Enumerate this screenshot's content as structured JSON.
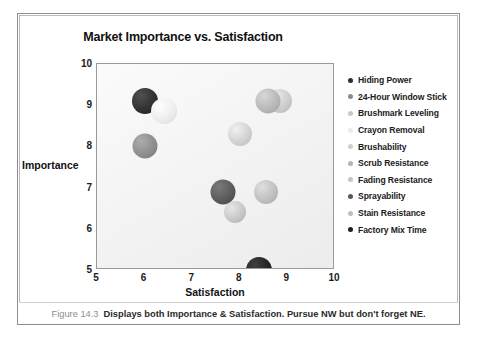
{
  "figure": {
    "caption_number": "Figure 14.3",
    "caption_text": "Displays both Importance & Satisfaction. Pursue NW but don't forget NE."
  },
  "chart_data": {
    "type": "scatter",
    "title": "Market Importance vs. Satisfaction",
    "xlabel": "Satisfaction",
    "ylabel": "Importance",
    "xlim": [
      5,
      10
    ],
    "ylim": [
      5,
      10
    ],
    "xticks": [
      "5",
      "6",
      "7",
      "8",
      "9",
      "10"
    ],
    "yticks": [
      "5",
      "6",
      "7",
      "8",
      "9",
      "10"
    ],
    "grid": false,
    "legend_position": "right",
    "series": [
      {
        "name": "Hiding Power",
        "x": 6.0,
        "y": 9.1,
        "color": "#2e2e2e",
        "size": 26
      },
      {
        "name": "24-Hour Window Stick",
        "x": 6.0,
        "y": 8.0,
        "color": "#8b8b8b",
        "size": 25
      },
      {
        "name": "Brushmark Leveling",
        "x": 8.85,
        "y": 9.1,
        "color": "#c9c9c9",
        "size": 24
      },
      {
        "name": "Crayon Removal",
        "x": 6.4,
        "y": 8.85,
        "color": "#ebebeb",
        "size": 26
      },
      {
        "name": "Brushability",
        "x": 8.0,
        "y": 8.3,
        "color": "#cfcfcf",
        "size": 24
      },
      {
        "name": "Scrub Resistance",
        "x": 8.6,
        "y": 9.1,
        "color": "#b5b5b5",
        "size": 25
      },
      {
        "name": "Fading Resistance",
        "x": 7.9,
        "y": 6.4,
        "color": "#c4c4c4",
        "size": 22
      },
      {
        "name": "Sprayability",
        "x": 7.65,
        "y": 6.9,
        "color": "#585858",
        "size": 25
      },
      {
        "name": "Stain Resistance",
        "x": 8.55,
        "y": 6.9,
        "color": "#bdbdbd",
        "size": 24
      },
      {
        "name": "Factory Mix Time",
        "x": 8.4,
        "y": 5.0,
        "color": "#1f1f1f",
        "size": 26
      }
    ]
  }
}
